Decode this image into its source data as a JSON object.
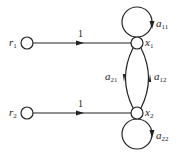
{
  "diagram": {
    "type": "signal-flow-graph",
    "nodes": [
      {
        "id": "r1",
        "label": "r",
        "sub": "1",
        "x": 27,
        "y": 43
      },
      {
        "id": "x1",
        "label": "x",
        "sub": "1",
        "x": 137,
        "y": 43
      },
      {
        "id": "r2",
        "label": "r",
        "sub": "2",
        "x": 27,
        "y": 113
      },
      {
        "id": "x2",
        "label": "x",
        "sub": "2",
        "x": 137,
        "y": 113
      }
    ],
    "edges": [
      {
        "from": "r1",
        "to": "x1",
        "gain": "1"
      },
      {
        "from": "r2",
        "to": "x2",
        "gain": "1"
      },
      {
        "from": "x1",
        "to": "x1",
        "gain": "a",
        "gain_sub": "11",
        "kind": "self-loop"
      },
      {
        "from": "x1",
        "to": "x2",
        "gain": "a",
        "gain_sub": "21"
      },
      {
        "from": "x2",
        "to": "x1",
        "gain": "a",
        "gain_sub": "12"
      },
      {
        "from": "x2",
        "to": "x2",
        "gain": "a",
        "gain_sub": "22",
        "kind": "self-loop"
      }
    ],
    "labels": {
      "r1": {
        "main": "r",
        "sub": "1"
      },
      "r2": {
        "main": "r",
        "sub": "2"
      },
      "x1": {
        "main": "x",
        "sub": "1"
      },
      "x2": {
        "main": "x",
        "sub": "2"
      },
      "gain_r1_x1": "1",
      "gain_r2_x2": "1",
      "a11": {
        "main": "a",
        "sub": "11"
      },
      "a21": {
        "main": "a",
        "sub": "21"
      },
      "a12": {
        "main": "a",
        "sub": "12"
      },
      "a22": {
        "main": "a",
        "sub": "22"
      }
    },
    "colors": {
      "stroke": "#222222",
      "background": "#ffffff"
    }
  }
}
